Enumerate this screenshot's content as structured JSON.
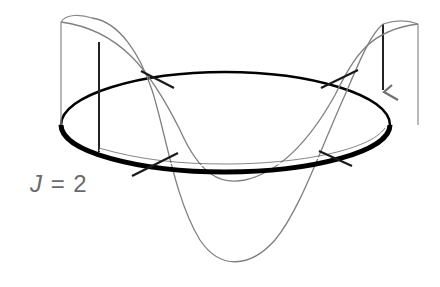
{
  "diagram": {
    "label": {
      "variable": "J",
      "equals": "=",
      "value": "2"
    },
    "colors": {
      "ring": "#000000",
      "wave": "#808080",
      "node_marks": "#1a1a1a",
      "label": "#6a6a6a",
      "background": "#ffffff"
    },
    "elements": {
      "ring": "ellipse",
      "waves": [
        "wave-positive",
        "wave-negative"
      ],
      "node_marks": 4,
      "arrow": "direction-arrow"
    }
  }
}
